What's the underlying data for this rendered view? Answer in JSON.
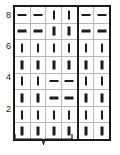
{
  "chart_data": {
    "type": "table",
    "xlabel": "",
    "ylabel": "",
    "columns": 6,
    "rows": 8,
    "legend": [
      {
        "symbol": "vertical-bar",
        "name": "knit"
      },
      {
        "symbol": "horizontal-dash",
        "name": "purl"
      }
    ],
    "row_labels_left": [
      "8",
      "",
      "6",
      "",
      "4",
      "",
      "2",
      ""
    ],
    "row_labels_right": [
      "",
      "7",
      "",
      "5",
      "",
      "3",
      "",
      "1"
    ],
    "row_numbers_top_to_bottom": [
      8,
      7,
      6,
      5,
      4,
      3,
      2,
      1
    ],
    "repeat_boundary_after_column": 4,
    "grid_rows_top_to_bottom": [
      {
        "row": 8,
        "weight": "light",
        "cells": [
          "purl",
          "purl",
          "knit",
          "knit",
          "purl",
          "purl"
        ]
      },
      {
        "row": 7,
        "weight": "bold",
        "cells": [
          "purl",
          "purl",
          "knit",
          "knit",
          "purl",
          "purl"
        ]
      },
      {
        "row": 6,
        "weight": "light",
        "cells": [
          "knit",
          "knit",
          "knit",
          "knit",
          "knit",
          "knit"
        ]
      },
      {
        "row": 5,
        "weight": "bold",
        "cells": [
          "knit",
          "knit",
          "knit",
          "knit",
          "knit",
          "knit"
        ]
      },
      {
        "row": 4,
        "weight": "light",
        "cells": [
          "knit",
          "knit",
          "purl",
          "purl",
          "knit",
          "knit"
        ]
      },
      {
        "row": 3,
        "weight": "bold",
        "cells": [
          "knit",
          "knit",
          "purl",
          "purl",
          "knit",
          "knit"
        ]
      },
      {
        "row": 2,
        "weight": "light",
        "cells": [
          "knit",
          "knit",
          "knit",
          "knit",
          "knit",
          "knit"
        ]
      },
      {
        "row": 1,
        "weight": "bold",
        "cells": [
          "knit",
          "knit",
          "knit",
          "knit",
          "knit",
          "knit"
        ]
      }
    ]
  },
  "labels": {
    "left": [
      "8",
      "6",
      "4",
      "2"
    ],
    "right": [
      "7",
      "5",
      "3",
      "1"
    ]
  },
  "repeat": {
    "caption": "",
    "spans_columns": 4
  },
  "colors": {
    "ink": "#1c1c1c",
    "gridline": "#b8b8b8",
    "background": "#ffffff",
    "caption": "#555555"
  }
}
